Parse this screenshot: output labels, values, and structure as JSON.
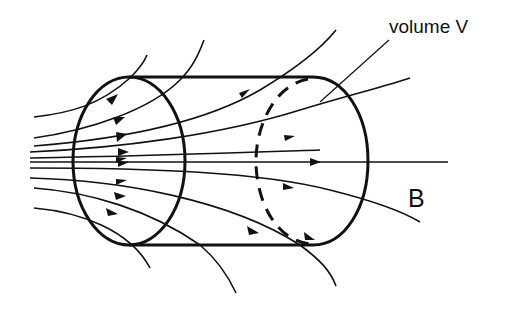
{
  "diagram": {
    "type": "physics-figure",
    "labels": {
      "volume": "volume V",
      "field": "B"
    },
    "colors": {
      "background": "#ffffff",
      "ink": "#111111"
    },
    "elements": {
      "cylinder": {
        "front_face": "solid ellipse",
        "back_face": "dashed arc (hidden edge)",
        "sides": "solid lines"
      },
      "field_lines_count": 11,
      "arrow_direction": "left-to-right (diverging)"
    }
  }
}
